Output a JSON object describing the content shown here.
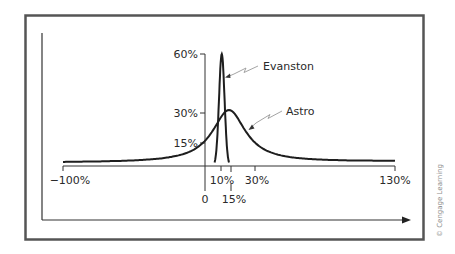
{
  "chart_data": {
    "type": "line",
    "title": "",
    "xlabel": "",
    "ylabel": "",
    "series": [
      {
        "name": "Evanston",
        "description": "Narrow, tall distribution centered at 10% with peak probability 60%",
        "mean": 10,
        "peak": 60,
        "x_range": [
          5,
          15
        ]
      },
      {
        "name": "Astro",
        "description": "Wide distribution centered at 15% with peak probability 30%, tails spanning -100% to 130%",
        "mean": 15,
        "peak": 30,
        "x_range": [
          -100,
          130
        ]
      }
    ],
    "x_ticks": [
      "-100%",
      "0",
      "10%",
      "15%",
      "30%",
      "130%"
    ],
    "x_tick_values": [
      -100,
      0,
      10,
      15,
      30,
      130
    ],
    "y_ticks": [
      "15%",
      "30%",
      "60%"
    ],
    "y_tick_values": [
      15,
      30,
      60
    ],
    "xlim": [
      -100,
      130
    ],
    "ylim": [
      0,
      60
    ],
    "grid": false,
    "legend": "inline labels with arrows"
  },
  "labels": {
    "evanston": "Evanston",
    "astro": "Astro",
    "x_tick_neg100": "−100%",
    "x_tick_0": "0",
    "x_tick_10": "10%",
    "x_tick_15": "15%",
    "x_tick_30": "30%",
    "x_tick_130": "130%",
    "y_tick_15": "15%",
    "y_tick_30": "30%",
    "y_tick_60": "60%"
  },
  "credit": "© Cengage Learning",
  "colors": {
    "frame": "#555555",
    "curve": "#1e1e1e",
    "axis": "#333333",
    "leader": "#9a9a9a",
    "text": "#2a2a2a"
  }
}
